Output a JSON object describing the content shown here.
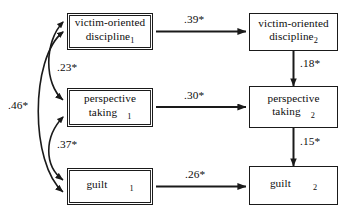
{
  "diagram": {
    "type": "path-diagram",
    "title": "",
    "nodes": [
      {
        "id": "vod1",
        "line1": "victim-oriented",
        "line2": "discipline",
        "subscript": "1",
        "wave": "1",
        "col": "left",
        "row": 1
      },
      {
        "id": "pt1",
        "line1": "perspective",
        "line2": "taking",
        "subscript": "1",
        "wave": "1",
        "col": "left",
        "row": 2
      },
      {
        "id": "guilt1",
        "line1": "",
        "line2": "guilt",
        "subscript": "1",
        "wave": "1",
        "col": "left",
        "row": 3
      },
      {
        "id": "vod2",
        "line1": "victim-oriented",
        "line2": "discipline",
        "subscript": "2",
        "wave": "2",
        "col": "right",
        "row": 1
      },
      {
        "id": "pt2",
        "line1": "perspective",
        "line2": "taking",
        "subscript": "2",
        "wave": "2",
        "col": "right",
        "row": 2
      },
      {
        "id": "guilt2",
        "line1": "",
        "line2": "guilt",
        "subscript": "2",
        "wave": "2",
        "col": "right",
        "row": 3
      }
    ],
    "paths": [
      {
        "id": "p-vod",
        "from": "vod1",
        "to": "vod2",
        "label": ".39*",
        "kind": "directed",
        "orientation": "horizontal"
      },
      {
        "id": "p-pt",
        "from": "pt1",
        "to": "pt2",
        "label": ".30*",
        "kind": "directed",
        "orientation": "horizontal"
      },
      {
        "id": "p-guilt",
        "from": "guilt1",
        "to": "guilt2",
        "label": ".26*",
        "kind": "directed",
        "orientation": "horizontal"
      },
      {
        "id": "p-vod-pt",
        "from": "vod2",
        "to": "pt2",
        "label": ".18*",
        "kind": "directed",
        "orientation": "vertical"
      },
      {
        "id": "p-pt-guilt",
        "from": "pt2",
        "to": "guilt2",
        "label": ".15*",
        "kind": "directed",
        "orientation": "vertical"
      }
    ],
    "correlations": [
      {
        "id": "c-vod-pt",
        "between": [
          "vod1",
          "pt1"
        ],
        "label": ".23*",
        "kind": "curved-double-headed"
      },
      {
        "id": "c-pt-guilt",
        "between": [
          "pt1",
          "guilt1"
        ],
        "label": ".37*",
        "kind": "curved-double-headed"
      },
      {
        "id": "c-vod-guilt",
        "between": [
          "vod1",
          "guilt1"
        ],
        "label": ".46*",
        "kind": "curved-double-headed"
      }
    ],
    "colors": {
      "stroke": "#1a1a1a",
      "text": "#0d0d0d",
      "background": "#ffffff"
    }
  }
}
